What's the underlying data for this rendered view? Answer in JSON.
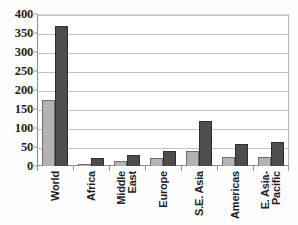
{
  "chart_data": {
    "type": "bar",
    "title": "",
    "xlabel": "",
    "ylabel": "",
    "ylim": [
      0,
      400
    ],
    "yticks": [
      0,
      50,
      100,
      150,
      200,
      250,
      300,
      350,
      400
    ],
    "ytick_labels": [
      "0",
      "50",
      "100",
      "150",
      "200",
      "250",
      "300",
      "350",
      "400"
    ],
    "grid": true,
    "legend": "none",
    "categories": [
      "World",
      "Africa",
      "Middle East",
      "Europe",
      "S.E. Asia",
      "Americas",
      "E. Asia-Pacific"
    ],
    "category_label_lines": [
      [
        "World"
      ],
      [
        "Africa"
      ],
      [
        "Middle",
        "East"
      ],
      [
        "Europe"
      ],
      [
        "S.E. Asia"
      ],
      [
        "Americas"
      ],
      [
        "E. Asia-",
        "Pacific"
      ]
    ],
    "series": [
      {
        "name": "series-1",
        "color": "#b3b3b3",
        "values": [
          175,
          5,
          12,
          22,
          40,
          25,
          25
        ]
      },
      {
        "name": "series-2",
        "color": "#4d4d4d",
        "values": [
          368,
          20,
          30,
          40,
          118,
          57,
          63
        ]
      }
    ]
  },
  "colors": {
    "series_light": "#b3b3b3",
    "series_dark": "#4d4d4d",
    "gridline": "#c2c2c2",
    "axis": "#8e8e8e",
    "text": "#1d1d1d",
    "background": "#ffffff"
  }
}
